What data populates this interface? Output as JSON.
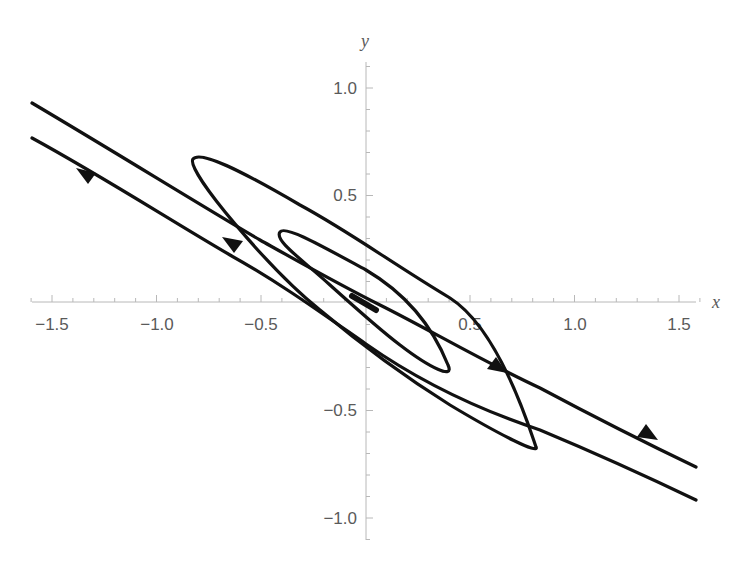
{
  "chart_data": {
    "type": "line",
    "title": "",
    "subtitle": "",
    "xlabel": "x",
    "ylabel": "y",
    "xlim": [
      -1.6,
      1.6
    ],
    "ylim": [
      -1.1,
      1.1
    ],
    "grid": false,
    "legend": null,
    "axes_style": "axes through origin",
    "x_ticks": [
      -1.5,
      -1.0,
      -0.5,
      0.5,
      1.0,
      1.5
    ],
    "x_tick_labels": [
      "−1.5",
      "−1.0",
      "−0.5",
      "0.5",
      "1.0",
      "1.5"
    ],
    "y_ticks": [
      1.0,
      0.5,
      -0.5,
      -1.0
    ],
    "y_tick_labels": [
      "1.0",
      "0.5",
      "−0.5",
      "−1.0"
    ],
    "series": [
      {
        "name": "trajectory-upper",
        "direction": "lower-right toward upper-left on left side, upper-left to lower-right on right side",
        "points": [
          [
            -1.6,
            0.93
          ],
          [
            -1.0,
            0.58
          ],
          [
            -0.5,
            0.28
          ],
          [
            0.0,
            0.02
          ],
          [
            0.5,
            -0.25
          ],
          [
            1.0,
            -0.5
          ],
          [
            1.6,
            -0.77
          ]
        ]
      },
      {
        "name": "trajectory-lower",
        "points": [
          [
            -1.6,
            0.77
          ],
          [
            -1.0,
            0.45
          ],
          [
            -0.5,
            0.12
          ],
          [
            0.0,
            -0.2
          ],
          [
            0.5,
            -0.47
          ],
          [
            1.0,
            -0.66
          ],
          [
            1.6,
            -0.92
          ]
        ]
      },
      {
        "name": "spiral-outer-loop",
        "points": [
          [
            -0.82,
            0.67
          ],
          [
            -0.5,
            0.45
          ],
          [
            0.0,
            0.21
          ],
          [
            0.5,
            -0.1
          ],
          [
            0.8,
            -0.67
          ],
          [
            0.3,
            -0.5
          ],
          [
            0.0,
            -0.17
          ],
          [
            -0.5,
            0.25
          ],
          [
            -0.82,
            0.67
          ]
        ]
      },
      {
        "name": "spiral-inner-loop",
        "points": [
          [
            -0.41,
            0.33
          ],
          [
            0.0,
            0.14
          ],
          [
            0.4,
            -0.2
          ],
          [
            0.4,
            -0.33
          ],
          [
            0.0,
            -0.12
          ],
          [
            -0.41,
            0.33
          ]
        ]
      },
      {
        "name": "spiral-core",
        "points": [
          [
            -0.05,
            0.03
          ],
          [
            0.05,
            -0.03
          ]
        ]
      }
    ],
    "arrows": [
      {
        "at": [
          -1.33,
          0.64
        ],
        "direction": "up-left"
      },
      {
        "at": [
          -0.63,
          0.28
        ],
        "direction": "up-left"
      },
      {
        "at": [
          0.62,
          -0.29
        ],
        "direction": "down-right"
      },
      {
        "at": [
          1.35,
          -0.6
        ],
        "direction": "down-right"
      }
    ]
  }
}
